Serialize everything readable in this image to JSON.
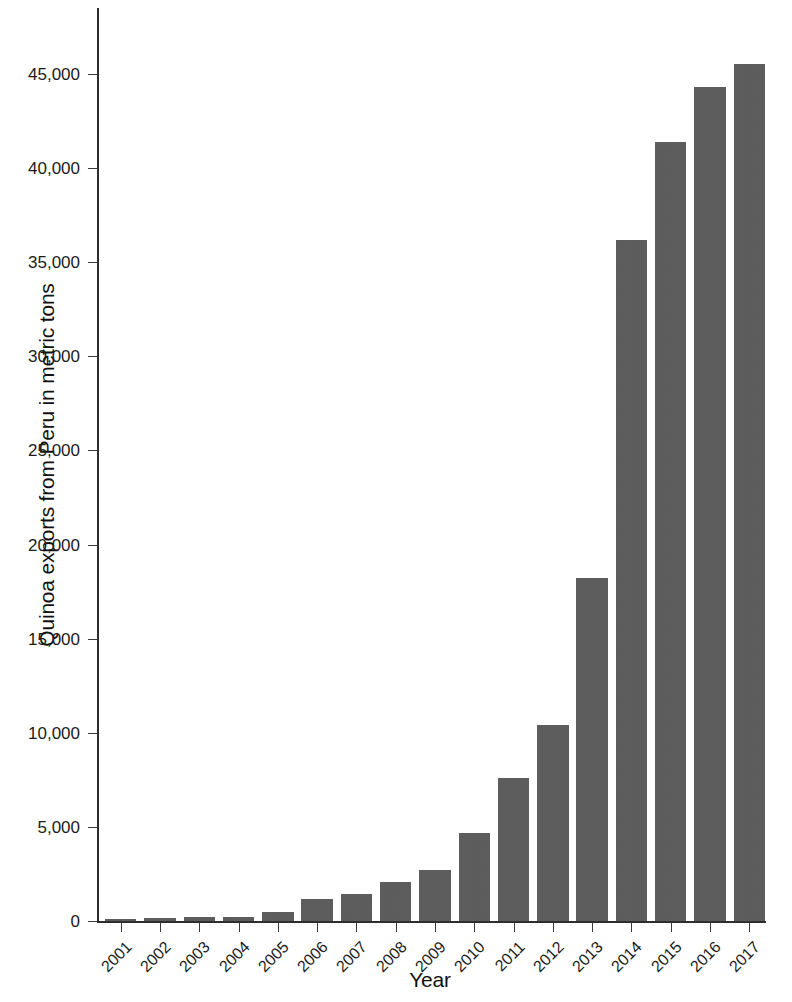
{
  "chart_data": {
    "type": "bar",
    "title": "",
    "xlabel": "Year",
    "ylabel": "Quinoa exports from Peru in metric tons",
    "categories": [
      "2001",
      "2002",
      "2003",
      "2004",
      "2005",
      "2006",
      "2007",
      "2008",
      "2009",
      "2010",
      "2011",
      "2012",
      "2013",
      "2014",
      "2015",
      "2016",
      "2017"
    ],
    "values": [
      120,
      160,
      220,
      200,
      490,
      1150,
      1450,
      2050,
      2700,
      4650,
      7600,
      10400,
      18200,
      36200,
      41400,
      44300,
      45500
    ],
    "ylim": [
      0,
      48500
    ],
    "yticks": [
      0,
      5000,
      10000,
      15000,
      20000,
      25000,
      30000,
      35000,
      40000,
      45000
    ],
    "ytick_labels": [
      "0",
      "5,000",
      "10,000",
      "15,000",
      "20,000",
      "25,000",
      "30,000",
      "35,000",
      "40,000",
      "45,000"
    ],
    "grid": false,
    "legend": null,
    "bar_color": "#5a5a5a",
    "axis_color": "#2e2e2e",
    "background_color": "#ffffff"
  }
}
